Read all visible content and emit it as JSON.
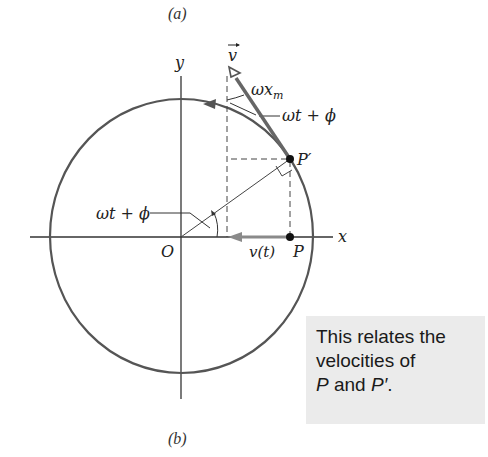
{
  "figure": {
    "caption_top": "(a)",
    "caption_bottom": "(b)",
    "labels": {
      "y_axis": "y",
      "x_axis": "x",
      "origin": "O",
      "vector": "v",
      "magnitude": "ωx",
      "magnitude_sub": "m",
      "angle_top": "ωt + ϕ",
      "angle_origin": "ωt + ϕ",
      "point_prime": "P′",
      "point": "P",
      "velocity": "v(t)"
    },
    "colors": {
      "circle": "#555555",
      "vector_arrow": "#666666",
      "v_arrow": "#8a8a8a",
      "callout_bg": "#ebebeb"
    }
  },
  "callout": {
    "line1": "This relates the",
    "line2": "velocities of",
    "line3_p": "P",
    "line3_and": " and ",
    "line3_pprime": "P′",
    "line3_end": "."
  }
}
